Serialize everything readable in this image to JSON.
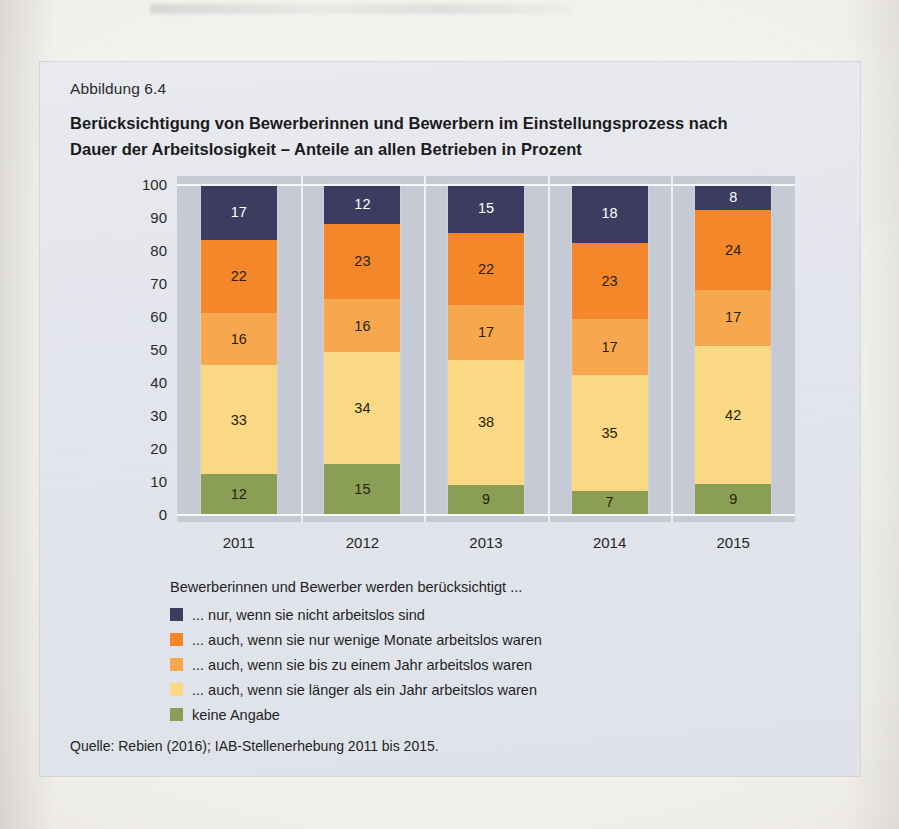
{
  "figure": {
    "number_label": "Abbildung 6.4",
    "headline": "Berücksichtigung von Bewerberinnen und Bewerbern im Einstellungsprozess nach Dauer der Arbeitslosigkeit – Anteile an allen Betrieben in Prozent",
    "source": "Quelle: Rebien (2016); IAB-Stellenerhebung 2011 bis 2015."
  },
  "legend": {
    "title": "Bewerberinnen und Bewerber werden berücksichtigt ...",
    "items": [
      {
        "label": "... nur, wenn sie nicht arbeitslos sind",
        "color": "#3c3c60"
      },
      {
        "label": "... auch, wenn sie nur wenige Monate arbeitslos waren",
        "color": "#f3872a"
      },
      {
        "label": "... auch, wenn sie bis zu einem Jahr arbeitslos waren",
        "color": "#f7a84e"
      },
      {
        "label": "... auch, wenn sie länger als ein Jahr arbeitslos waren",
        "color": "#fbd883"
      },
      {
        "label": "keine Angabe",
        "color": "#8b9e55"
      }
    ]
  },
  "chart_data": {
    "type": "bar",
    "stacked": true,
    "title": "Berücksichtigung von Bewerberinnen und Bewerbern im Einstellungsprozess nach Dauer der Arbeitslosigkeit – Anteile an allen Betrieben in Prozent",
    "xlabel": "",
    "ylabel": "",
    "ylim": [
      0,
      100
    ],
    "yticks": [
      "0",
      "10",
      "20",
      "30",
      "40",
      "50",
      "60",
      "70",
      "80",
      "90",
      "100"
    ],
    "grid": false,
    "legend_position": "below",
    "categories": [
      "2011",
      "2012",
      "2013",
      "2014",
      "2015"
    ],
    "series": [
      {
        "name": "keine Angabe",
        "color": "#8b9e55",
        "text_color": "dark",
        "values": [
          12,
          15,
          9,
          7,
          9
        ]
      },
      {
        "name": "... auch, wenn sie länger als ein Jahr arbeitslos waren",
        "color": "#fbd883",
        "text_color": "dark",
        "values": [
          33,
          34,
          38,
          35,
          42
        ]
      },
      {
        "name": "... auch, wenn sie bis zu einem Jahr arbeitslos waren",
        "color": "#f7a84e",
        "text_color": "dark",
        "values": [
          16,
          16,
          17,
          17,
          17
        ]
      },
      {
        "name": "... auch, wenn sie nur wenige Monate arbeitslos waren",
        "color": "#f3872a",
        "text_color": "dark",
        "values": [
          22,
          23,
          22,
          23,
          24
        ]
      },
      {
        "name": "... nur, wenn sie nicht arbeitslos sind",
        "color": "#3c3c60",
        "text_color": "light",
        "values": [
          17,
          12,
          15,
          18,
          8
        ]
      }
    ]
  }
}
